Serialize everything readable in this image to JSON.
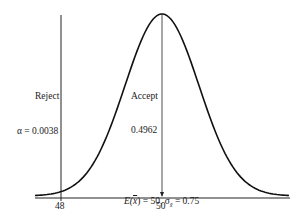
{
  "chart_data": {
    "type": "area",
    "title": "",
    "distribution": "normal",
    "mean": 50,
    "std_error": 0.75,
    "x_ticks": [
      "48",
      "50"
    ],
    "critical_value": 48,
    "regions": [
      {
        "name": "Reject",
        "probability": "α = 0.0038",
        "side": "left of 48"
      },
      {
        "name": "Accept",
        "probability": "0.4962",
        "side": "between 48 and 50"
      }
    ],
    "caption": "E(x̄) = 50,  σx̄ = 0.75",
    "grid": false
  },
  "labels": {
    "reject": "Reject",
    "alpha": "α = 0.0038",
    "accept": "Accept",
    "accept_prob": "0.4962",
    "tick_48": "48",
    "tick_50": "50",
    "caption_left": "E(",
    "caption_xbar": "x",
    "caption_mid": ") = 50,  σ",
    "caption_sub": "x̄",
    "caption_right": " = 0.75"
  }
}
